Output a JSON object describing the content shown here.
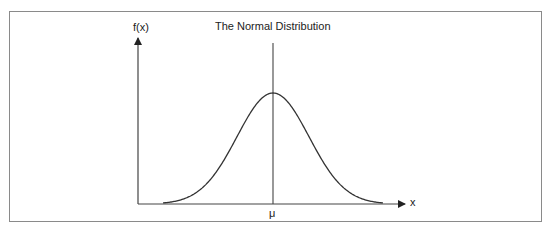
{
  "title": "The Normal Distribution",
  "y_axis_label": "f(x)",
  "x_axis_label": "x",
  "mean_label": "μ",
  "chart_data": {
    "type": "line",
    "title": "The Normal Distribution",
    "xlabel": "x",
    "ylabel": "f(x)",
    "annotations": [
      "μ (vertical line at the mean)"
    ],
    "grid": false
  }
}
